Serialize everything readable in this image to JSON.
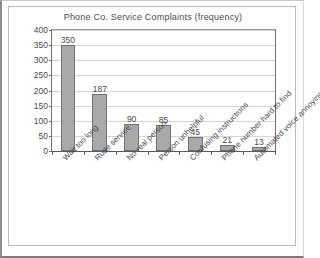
{
  "chart_data": {
    "type": "bar",
    "title": "Phone Co. Service Complaints (frequency)",
    "xlabel": "",
    "ylabel": "",
    "categories": [
      "Wait too long",
      "Rude service",
      "No real person",
      "Person unhelpful",
      "Confusing instructions",
      "Phone number hard to find",
      "Automated voice annoying"
    ],
    "values": [
      350,
      187,
      90,
      85,
      45,
      21,
      13
    ],
    "ylim": [
      0,
      400
    ],
    "ytick_labels": [
      "400",
      "350",
      "300",
      "250",
      "200",
      "150",
      "100",
      "50",
      "0"
    ],
    "ytick_values": [
      400,
      350,
      300,
      250,
      200,
      150,
      100,
      50,
      0
    ],
    "grid": true,
    "legend": null,
    "bar_color": "#a9a9a9",
    "bar_border_color": "#717171",
    "grid_color": "#d5d5d5",
    "axis_color": "#6e6e6e",
    "text_color": "#4a4a4a",
    "background_color": "#ffffff",
    "xlabel_rotation": -45
  }
}
